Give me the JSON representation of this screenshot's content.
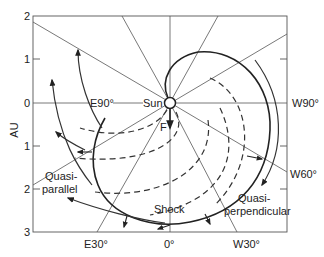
{
  "diagram": {
    "y_axis_label": "AU",
    "y_ticks": [
      "2",
      "1",
      "0",
      "1",
      "2",
      "3"
    ],
    "center_label": "Sun",
    "field_label": "F",
    "longitude_labels": {
      "e90": "E90°",
      "w90": "W90°",
      "w60": "W60°",
      "e30": "E30°",
      "zero": "0°",
      "w30": "W30°"
    },
    "region_labels": {
      "quasi_parallel_line1": "Quasi-",
      "quasi_parallel_line2": "parallel",
      "quasi_perpendicular_line1": "Quasi-",
      "quasi_perpendicular_line2": "perpendicular",
      "shock": "Shock"
    },
    "colors": {
      "ink": "#222222",
      "background": "#ffffff"
    }
  }
}
